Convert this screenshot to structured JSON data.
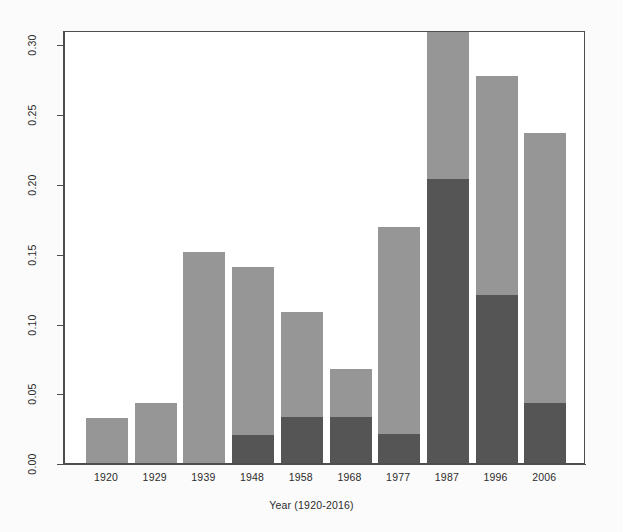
{
  "chart_data": {
    "type": "bar",
    "title": "",
    "subtitle": "",
    "xlabel": "Year (1920-2016)",
    "ylabel": "",
    "stacked": true,
    "grid": false,
    "legend": "none",
    "ylim": [
      0.0,
      0.31
    ],
    "xlim_note": "10 decade bins, equal width bars",
    "ytick_labels": [
      "0.00",
      "0.05",
      "0.10",
      "0.15",
      "0.20",
      "0.25",
      "0.30"
    ],
    "ytick_values": [
      0.0,
      0.05,
      0.1,
      0.15,
      0.2,
      0.25,
      0.3
    ],
    "categories": [
      "1920",
      "1929",
      "1939",
      "1948",
      "1958",
      "1968",
      "1977",
      "1987",
      "1996",
      "2006"
    ],
    "series": [
      {
        "name": "lower-segment",
        "color": "#555555",
        "values": [
          0.0,
          0.0,
          0.0,
          0.02,
          0.033,
          0.033,
          0.021,
          0.203,
          0.12,
          0.043
        ]
      },
      {
        "name": "upper-segment",
        "color": "#969696",
        "values": [
          0.032,
          0.043,
          0.151,
          0.12,
          0.075,
          0.034,
          0.148,
          0.107,
          0.157,
          0.193
        ]
      }
    ],
    "totals": [
      0.032,
      0.043,
      0.151,
      0.14,
      0.108,
      0.067,
      0.169,
      0.31,
      0.277,
      0.236
    ]
  },
  "colors": {
    "light_gray": "#969696",
    "dark_gray": "#555555",
    "axis": "#4d4d4d",
    "text": "#2b2b2b",
    "background": "#ffffff"
  }
}
